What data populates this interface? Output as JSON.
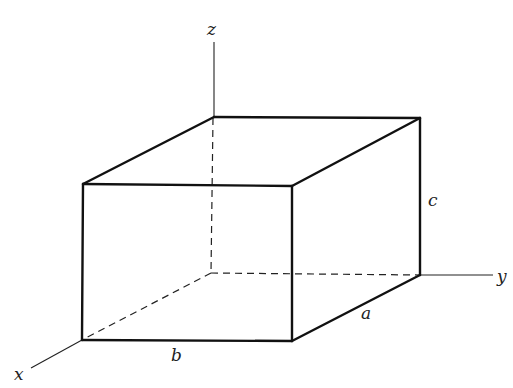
{
  "figure": {
    "axes": {
      "x_label": "x",
      "y_label": "y",
      "z_label": "z"
    },
    "dimensions": {
      "a_label": "a",
      "b_label": "b",
      "c_label": "c"
    },
    "colors": {
      "stroke": "#111111",
      "background": "#ffffff"
    }
  }
}
